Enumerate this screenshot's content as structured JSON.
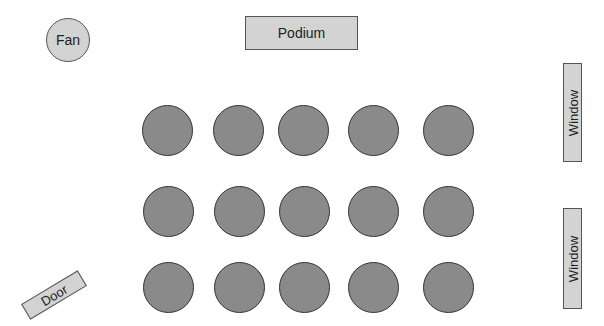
{
  "diagram": {
    "fan": {
      "label": "Fan"
    },
    "podium": {
      "label": "Podium"
    },
    "windows": [
      {
        "label": "Window"
      },
      {
        "label": "Window"
      }
    ],
    "door": {
      "label": "Door"
    },
    "seats": {
      "rows": 3,
      "cols": 5,
      "fill_color": "#8a8a8a"
    },
    "colors": {
      "fixture_fill": "#d3d3d3",
      "outline": "#555555",
      "background": "#ffffff"
    }
  }
}
